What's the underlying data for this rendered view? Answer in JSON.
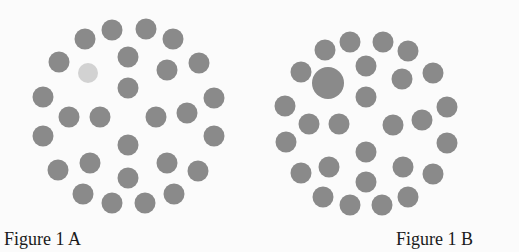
{
  "colors": {
    "dot": "#8a8a8a",
    "highlight_dot": "#d2d2d2",
    "background": "#fbfbfb"
  },
  "figures": [
    {
      "id": "A",
      "caption": "Figure 1 A",
      "caption_pos": {
        "x": 4,
        "y": 230
      },
      "dots": [
        {
          "x": 112,
          "y": 30,
          "d": 21
        },
        {
          "x": 146,
          "y": 29,
          "d": 21
        },
        {
          "x": 85,
          "y": 39,
          "d": 21
        },
        {
          "x": 173,
          "y": 39,
          "d": 21
        },
        {
          "x": 59,
          "y": 62,
          "d": 21
        },
        {
          "x": 128,
          "y": 57,
          "d": 21
        },
        {
          "x": 167,
          "y": 70,
          "d": 21
        },
        {
          "x": 199,
          "y": 63,
          "d": 21
        },
        {
          "x": 88,
          "y": 73,
          "d": 20,
          "variant": "highlight"
        },
        {
          "x": 128,
          "y": 88,
          "d": 21
        },
        {
          "x": 43,
          "y": 97,
          "d": 21
        },
        {
          "x": 69,
          "y": 117,
          "d": 21
        },
        {
          "x": 100,
          "y": 117,
          "d": 21
        },
        {
          "x": 156,
          "y": 117,
          "d": 21
        },
        {
          "x": 187,
          "y": 113,
          "d": 21
        },
        {
          "x": 214,
          "y": 98,
          "d": 21
        },
        {
          "x": 43,
          "y": 136,
          "d": 21
        },
        {
          "x": 214,
          "y": 136,
          "d": 21
        },
        {
          "x": 128,
          "y": 145,
          "d": 21
        },
        {
          "x": 58,
          "y": 170,
          "d": 21
        },
        {
          "x": 90,
          "y": 163,
          "d": 21
        },
        {
          "x": 167,
          "y": 163,
          "d": 21
        },
        {
          "x": 198,
          "y": 171,
          "d": 21
        },
        {
          "x": 128,
          "y": 178,
          "d": 21
        },
        {
          "x": 83,
          "y": 194,
          "d": 21
        },
        {
          "x": 112,
          "y": 203,
          "d": 21
        },
        {
          "x": 145,
          "y": 203,
          "d": 21
        },
        {
          "x": 174,
          "y": 194,
          "d": 21
        }
      ]
    },
    {
      "id": "B",
      "caption": "Figure 1 B",
      "caption_pos": {
        "x": 396,
        "y": 230
      },
      "dots": [
        {
          "x": 350,
          "y": 42,
          "d": 21
        },
        {
          "x": 383,
          "y": 42,
          "d": 21
        },
        {
          "x": 325,
          "y": 50,
          "d": 21
        },
        {
          "x": 408,
          "y": 51,
          "d": 21
        },
        {
          "x": 301,
          "y": 72,
          "d": 21
        },
        {
          "x": 366,
          "y": 66,
          "d": 21
        },
        {
          "x": 402,
          "y": 79,
          "d": 21
        },
        {
          "x": 433,
          "y": 73,
          "d": 21
        },
        {
          "x": 328,
          "y": 83,
          "d": 32,
          "variant": "large"
        },
        {
          "x": 366,
          "y": 97,
          "d": 21
        },
        {
          "x": 285,
          "y": 106,
          "d": 21
        },
        {
          "x": 309,
          "y": 124,
          "d": 21
        },
        {
          "x": 339,
          "y": 124,
          "d": 21
        },
        {
          "x": 393,
          "y": 125,
          "d": 21
        },
        {
          "x": 422,
          "y": 120,
          "d": 21
        },
        {
          "x": 447,
          "y": 107,
          "d": 21
        },
        {
          "x": 286,
          "y": 142,
          "d": 21
        },
        {
          "x": 447,
          "y": 143,
          "d": 21
        },
        {
          "x": 366,
          "y": 152,
          "d": 21
        },
        {
          "x": 301,
          "y": 173,
          "d": 21
        },
        {
          "x": 329,
          "y": 167,
          "d": 21
        },
        {
          "x": 403,
          "y": 167,
          "d": 21
        },
        {
          "x": 433,
          "y": 174,
          "d": 21
        },
        {
          "x": 366,
          "y": 182,
          "d": 21
        },
        {
          "x": 323,
          "y": 197,
          "d": 21
        },
        {
          "x": 350,
          "y": 205,
          "d": 21
        },
        {
          "x": 382,
          "y": 205,
          "d": 21
        },
        {
          "x": 408,
          "y": 197,
          "d": 21
        }
      ]
    }
  ]
}
